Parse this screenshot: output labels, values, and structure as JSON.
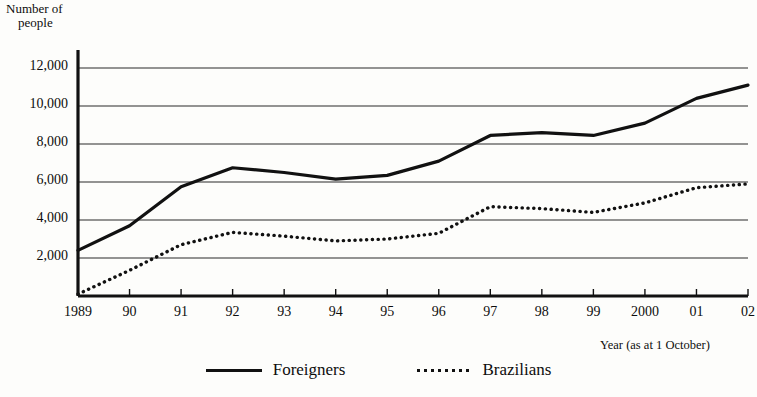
{
  "chart_data": {
    "type": "line",
    "title": "",
    "ylabel": "Number of\npeople",
    "ylabel_line1": "Number of",
    "ylabel_line2": "people",
    "xlabel": "Year (as at 1 October)",
    "categories": [
      "1989",
      "90",
      "91",
      "92",
      "93",
      "94",
      "95",
      "96",
      "97",
      "98",
      "99",
      "2000",
      "01",
      "02"
    ],
    "ytick_labels": [
      "2,000",
      "4,000",
      "6,000",
      "8,000",
      "10,000",
      "12,000"
    ],
    "ytick_values": [
      2000,
      4000,
      6000,
      8000,
      10000,
      12000
    ],
    "ylim": [
      0,
      12800
    ],
    "grid": true,
    "grid_axis": "y",
    "legend_position": "bottom-center",
    "series": [
      {
        "name": "Foreigners",
        "style": "solid",
        "color": "#111111",
        "values": [
          2400,
          3700,
          5750,
          6750,
          6500,
          6150,
          6350,
          7100,
          8450,
          8600,
          8450,
          9100,
          10400,
          11100
        ]
      },
      {
        "name": "Brazilians",
        "style": "dotted",
        "color": "#111111",
        "values": [
          100,
          1350,
          2700,
          3350,
          3150,
          2900,
          3000,
          3300,
          4700,
          4600,
          4400,
          4900,
          5700,
          5900
        ]
      }
    ]
  },
  "legend": {
    "items": [
      {
        "label": "Foreigners",
        "style": "solid"
      },
      {
        "label": "Brazilians",
        "style": "dotted"
      }
    ]
  }
}
